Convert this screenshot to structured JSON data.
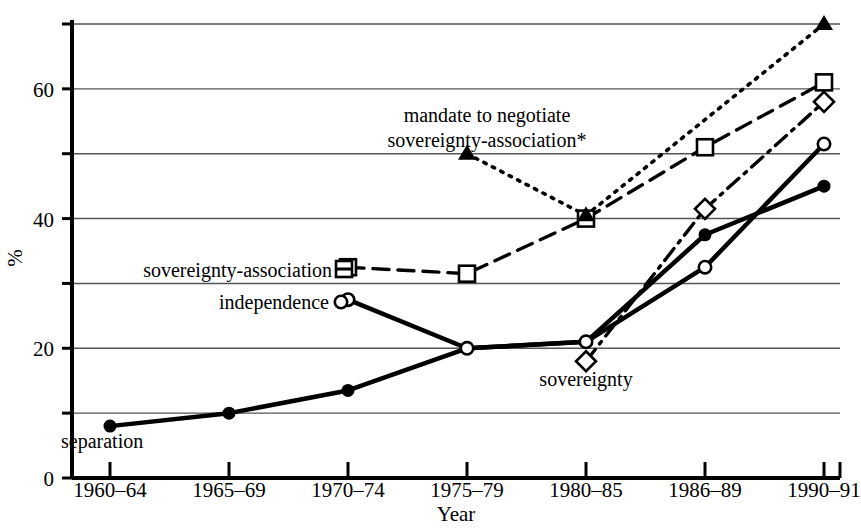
{
  "chart_data": {
    "type": "line",
    "title": "",
    "xlabel": "Year",
    "ylabel": "%",
    "categories": [
      "1960–64",
      "1965–69",
      "1970–74",
      "1975–79",
      "1980–85",
      "1986–89",
      "1990–91"
    ],
    "ylim": [
      0,
      70
    ],
    "yticks": [
      0,
      10,
      20,
      30,
      40,
      50,
      60,
      70
    ],
    "ytick_labels": [
      "0",
      "",
      "20",
      "",
      "40",
      "",
      "60",
      ""
    ],
    "grid": true,
    "legend": "inline-labels",
    "series": [
      {
        "name": "separation",
        "label": "separation",
        "marker": "filled-circle",
        "line": "solid",
        "values": [
          8,
          10,
          13.5,
          20,
          21,
          37.5,
          45
        ]
      },
      {
        "name": "independence",
        "label": "independence",
        "marker": "open-circle",
        "line": "solid",
        "values": [
          null,
          null,
          27.5,
          20,
          21,
          32.5,
          51.5
        ]
      },
      {
        "name": "sovereignty-association",
        "label": "sovereignty-association",
        "marker": "open-square",
        "line": "dashed",
        "values": [
          null,
          null,
          32.5,
          31.5,
          40,
          51,
          61
        ]
      },
      {
        "name": "sovereignty",
        "label": "sovereignty",
        "marker": "open-diamond",
        "line": "dash-dot",
        "values": [
          null,
          null,
          null,
          null,
          18,
          41.5,
          58
        ]
      },
      {
        "name": "mandate to negotiate sovereignty-association",
        "label": "mandate to negotiate sovereignty-association*",
        "marker": "filled-triangle",
        "line": "dotted",
        "values": [
          null,
          null,
          null,
          50,
          40.5,
          null,
          70
        ]
      }
    ]
  },
  "annotations": {
    "mandate_line1": "mandate to negotiate",
    "mandate_line2": "sovereignty-association*",
    "sovereignty_association_label": "sovereignty-association",
    "independence_label": "independence",
    "separation_label": "separation",
    "sovereignty_label": "sovereignty"
  },
  "axes": {
    "x_title": "Year",
    "y_title": "%"
  },
  "colors": {
    "ink": "#000000",
    "grid": "#555555",
    "background": "#ffffff"
  }
}
